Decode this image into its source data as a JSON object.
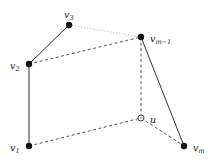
{
  "diagram": {
    "nodes": [
      {
        "id": "v3",
        "label": "v",
        "sub": "3",
        "style": "filled",
        "label_side": "top-right"
      },
      {
        "id": "v2",
        "label": "v",
        "sub": "2",
        "style": "filled",
        "label_side": "left"
      },
      {
        "id": "v1",
        "label": "v",
        "sub": "1",
        "style": "filled",
        "label_side": "left"
      },
      {
        "id": "vm1",
        "label": "v",
        "sub": "m−1",
        "style": "filled",
        "label_side": "right"
      },
      {
        "id": "u",
        "label": "u",
        "sub": "",
        "style": "open",
        "label_side": "right"
      },
      {
        "id": "vm",
        "label": "v",
        "sub": "m",
        "style": "filled",
        "label_side": "right"
      }
    ],
    "edges": [
      {
        "from": "v3",
        "to": "v2",
        "style": "solid"
      },
      {
        "from": "v2",
        "to": "v1",
        "style": "solid"
      },
      {
        "from": "v3",
        "to": "vm1",
        "style": "dotted"
      },
      {
        "from": "v2",
        "to": "vm1",
        "style": "dashed"
      },
      {
        "from": "vm1",
        "to": "u",
        "style": "dashed"
      },
      {
        "from": "vm1",
        "to": "vm",
        "style": "solid"
      },
      {
        "from": "v1",
        "to": "u",
        "style": "dashed"
      },
      {
        "from": "u",
        "to": "vm",
        "style": "dashed"
      }
    ]
  }
}
